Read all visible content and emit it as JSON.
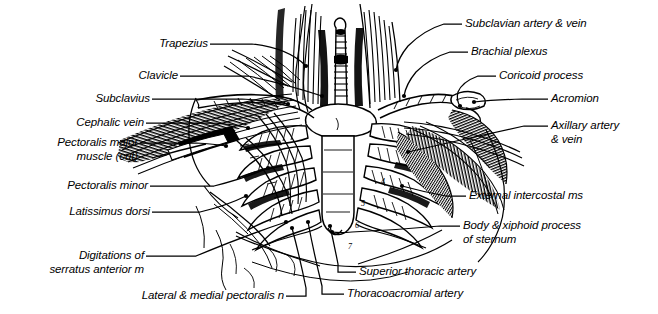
{
  "figure": {
    "background_color": "#ffffff",
    "ink_color": "#000000",
    "width": 658,
    "height": 314
  },
  "labels": {
    "trapezius": "Trapezius",
    "clavicle": "Clavicle",
    "subclavius": "Subclavius",
    "cephalic_vein": "Cephalic vein",
    "pectoralis_major_1": "Pectoralis major",
    "pectoralis_major_2": "muscle (cut)",
    "pectoralis_minor": "Pectoralis minor",
    "latissimus_dorsi": "Latissimus dorsi",
    "digitations_1": "Digitations of",
    "digitations_2": "serratus anterior m",
    "lateral_medial_pectoralis_n": "Lateral & medial pectoralis n",
    "superior_thoracic_artery": "Superior thoracic artery",
    "thoracoacromial_artery": "Thoracoacromial artery",
    "subclavian_artery_vein": "Subclavian artery & vein",
    "brachial_plexus": "Brachial plexus",
    "coricoid_process": "Coricoid process",
    "acromion": "Acromion",
    "axillary_artery_1": "Axillary artery",
    "axillary_artery_2": "& vein",
    "external_intercostal_ms": "External intercostal ms",
    "body_xiphoid_1": "Body & xiphoid process",
    "body_xiphoid_2": "of sternum"
  },
  "rib_numbers": [
    "4",
    "5",
    "6",
    "7"
  ]
}
